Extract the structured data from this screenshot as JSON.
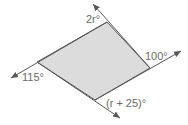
{
  "diagram": {
    "type": "quadrilateral-exterior-angles",
    "fill_color": "#dcdcdc",
    "line_color": "#555555",
    "labels": {
      "top": "2r°",
      "right": "100°",
      "left": "115°",
      "bottom": "(r + 25)°"
    }
  }
}
